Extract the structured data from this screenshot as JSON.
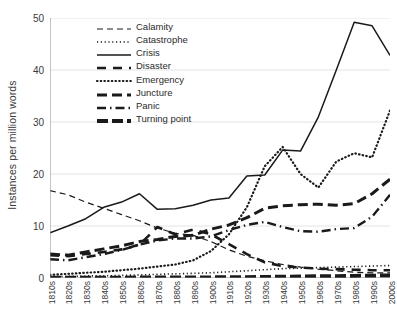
{
  "chart_data": {
    "type": "line",
    "title": "",
    "xlabel": "",
    "ylabel": "Instances per million words",
    "ylim": [
      0,
      50
    ],
    "yticks": [
      0,
      10,
      20,
      30,
      40,
      50
    ],
    "grid": true,
    "legend_position": "top-center-inside",
    "categories": [
      "1810s",
      "1820s",
      "1830s",
      "1840s",
      "1850s",
      "1860s",
      "1870s",
      "1880s",
      "1890s",
      "1900s",
      "1910s",
      "1920s",
      "1930s",
      "1940s",
      "1950s",
      "1960s",
      "1970s",
      "1980s",
      "1990s",
      "2000s"
    ],
    "series": [
      {
        "name": "Calamity",
        "style": "dashed",
        "color": "#1a1a1a",
        "values": [
          16.8,
          16.0,
          14.6,
          13.4,
          12.2,
          11.0,
          9.6,
          8.6,
          8.2,
          7.0,
          5.4,
          4.2,
          3.3,
          2.6,
          2.1,
          1.7,
          1.4,
          1.1,
          1.0,
          1.0
        ]
      },
      {
        "name": "Catastrophe",
        "style": "dotted",
        "color": "#1a1a1a",
        "values": [
          0.3,
          0.3,
          0.4,
          0.4,
          0.5,
          0.6,
          0.7,
          0.8,
          0.9,
          1.0,
          1.2,
          1.4,
          1.6,
          1.8,
          1.9,
          2.0,
          2.1,
          2.2,
          2.3,
          2.4
        ]
      },
      {
        "name": "Crisis",
        "style": "solid",
        "color": "#1a1a1a",
        "values": [
          8.7,
          10.0,
          11.4,
          13.6,
          14.6,
          16.2,
          13.2,
          13.3,
          14.0,
          15.0,
          15.4,
          19.6,
          19.8,
          24.6,
          24.4,
          31.0,
          40.0,
          49.2,
          48.5,
          42.8
        ]
      },
      {
        "name": "Disaster",
        "style": "dash-long",
        "color": "#1a1a1a",
        "values": [
          4.4,
          4.2,
          4.6,
          5.0,
          5.5,
          6.4,
          9.8,
          8.4,
          9.3,
          8.4,
          6.5,
          4.6,
          3.0,
          2.3,
          2.0,
          1.8,
          1.7,
          1.6,
          1.5,
          1.5
        ]
      },
      {
        "name": "Emergency",
        "style": "dotted-fine",
        "color": "#1a1a1a",
        "values": [
          0.6,
          0.8,
          1.0,
          1.2,
          1.5,
          1.8,
          2.2,
          2.6,
          3.4,
          5.2,
          8.4,
          13.6,
          21.5,
          25.2,
          20.0,
          17.4,
          22.4,
          24.0,
          23.2,
          32.2
        ]
      },
      {
        "name": "Juncture",
        "style": "dash-heavy",
        "color": "#1a1a1a",
        "values": [
          4.6,
          4.4,
          5.0,
          5.6,
          6.2,
          7.0,
          7.4,
          8.0,
          8.2,
          9.4,
          10.2,
          11.6,
          13.4,
          13.9,
          14.1,
          14.2,
          14.0,
          14.3,
          16.2,
          19.0
        ]
      },
      {
        "name": "Panic",
        "style": "dash-dot",
        "color": "#1a1a1a",
        "values": [
          3.6,
          3.4,
          4.0,
          4.6,
          5.4,
          6.4,
          7.2,
          7.6,
          7.6,
          8.0,
          9.2,
          10.2,
          10.8,
          9.8,
          9.0,
          8.9,
          9.4,
          9.6,
          11.8,
          16.0
        ]
      },
      {
        "name": "Turning point",
        "style": "dash-thick",
        "color": "#1a1a1a",
        "values": [
          0.05,
          0.05,
          0.06,
          0.06,
          0.07,
          0.08,
          0.08,
          0.09,
          0.1,
          0.12,
          0.14,
          0.16,
          0.2,
          0.24,
          0.28,
          0.32,
          0.36,
          0.4,
          0.44,
          0.5
        ]
      }
    ]
  },
  "legend": {
    "items": [
      {
        "label": "Calamity"
      },
      {
        "label": "Catastrophe"
      },
      {
        "label": "Crisis"
      },
      {
        "label": "Disaster"
      },
      {
        "label": "Emergency"
      },
      {
        "label": "Juncture"
      },
      {
        "label": "Panic"
      },
      {
        "label": "Turning point"
      }
    ]
  }
}
